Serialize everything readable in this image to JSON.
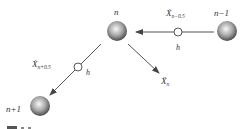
{
  "diagram": {
    "nodes": [
      {
        "id": "n",
        "label": "n"
      },
      {
        "id": "n_minus_1",
        "label": "n−1"
      },
      {
        "id": "n_plus_1",
        "label": "n+1"
      }
    ],
    "edges": [
      {
        "from": "n_minus_1",
        "to": "n",
        "velocity_label": "Ẋ",
        "velocity_sub": "n−0.5",
        "spring_label": "h"
      },
      {
        "from": "n",
        "to": "n_plus_1",
        "velocity_label": "Ẋ",
        "velocity_sub": "n+0.5",
        "spring_label": "h"
      }
    ],
    "acceleration": {
      "label": "Ẍ",
      "sub": "n"
    },
    "caption": "图 3.x"
  },
  "colors": {
    "line": "#444444",
    "ball_light": "#f4f4f4",
    "ball_dark": "#555555",
    "text": "#333333"
  }
}
